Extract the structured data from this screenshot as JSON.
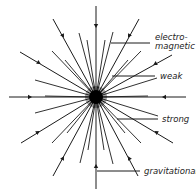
{
  "diagram": {
    "center": [
      96,
      97
    ],
    "ink_color": "#1a1a1a",
    "labels": {
      "electromagnetic_1": "electro-",
      "electromagnetic_2": "magnetic",
      "weak": "weak",
      "strong": "strong",
      "gravitational": "gravitational"
    },
    "long_lines": [
      {
        "end": [
          96,
          6
        ],
        "arrow": [
          96,
          26
        ]
      },
      {
        "end": [
          96,
          189
        ],
        "arrow": [
          96,
          166
        ]
      },
      {
        "end": [
          9,
          97
        ],
        "arrow": [
          30,
          97
        ]
      },
      {
        "end": [
          186,
          97
        ],
        "arrow": [
          164,
          97
        ]
      },
      {
        "end": [
          53,
          19
        ],
        "arrow": [
          63,
          36
        ]
      },
      {
        "end": [
          139,
          19
        ],
        "arrow": [
          129,
          36
        ]
      },
      {
        "end": [
          20,
          52
        ],
        "arrow": [
          39,
          63
        ]
      },
      {
        "end": [
          172,
          55
        ],
        "arrow": [
          155,
          64
        ]
      },
      {
        "end": [
          21,
          143
        ],
        "arrow": [
          38,
          132
        ]
      },
      {
        "end": [
          173,
          143
        ],
        "arrow": [
          156,
          132
        ]
      },
      {
        "end": [
          53,
          176
        ],
        "arrow": [
          63,
          158
        ]
      },
      {
        "end": [
          138,
          176
        ],
        "arrow": [
          129,
          158
        ]
      }
    ],
    "short_lines": [
      [
        79,
        33
      ],
      [
        113,
        32
      ],
      [
        52,
        51
      ],
      [
        141,
        51
      ],
      [
        35,
        80
      ],
      [
        157,
        78
      ],
      [
        35,
        113
      ],
      [
        158,
        116
      ],
      [
        52,
        143
      ],
      [
        141,
        143
      ],
      [
        80,
        163
      ],
      [
        113,
        164
      ],
      [
        87,
        40
      ],
      [
        105,
        40
      ],
      [
        65,
        60
      ],
      [
        128,
        60
      ],
      [
        45,
        96
      ],
      [
        148,
        96
      ],
      [
        67,
        133
      ],
      [
        125,
        133
      ],
      [
        88,
        150
      ],
      [
        104,
        150
      ]
    ],
    "leaders": [
      {
        "from": [
          111,
          43
        ],
        "to": [
          150,
          43
        ]
      },
      {
        "from": [
          112,
          76
        ],
        "to": [
          155,
          76
        ]
      },
      {
        "from": [
          117,
          119
        ],
        "to": [
          158,
          119
        ]
      },
      {
        "from": [
          97,
          171
        ],
        "to": [
          140,
          171
        ]
      }
    ]
  }
}
